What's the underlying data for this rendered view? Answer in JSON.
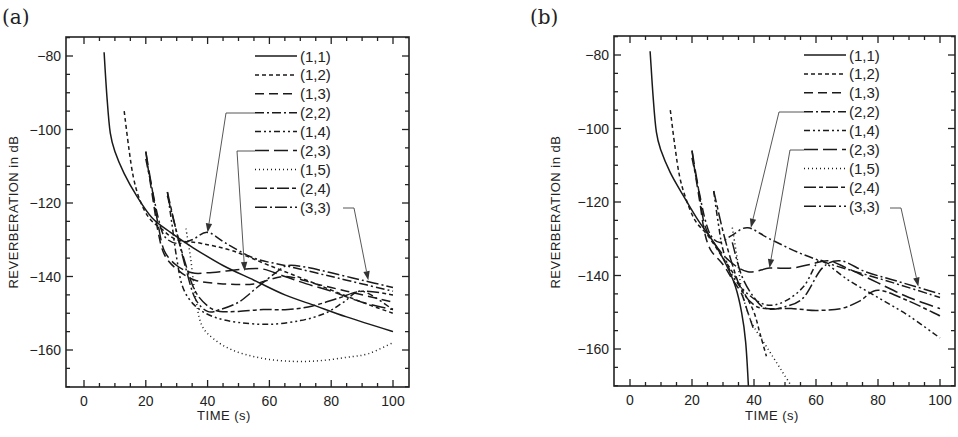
{
  "chart_data": [
    {
      "panel": "(a)",
      "type": "line",
      "title": "",
      "xlabel": "TIME (s)",
      "ylabel": "REVERBERATION in dB",
      "xlim": [
        -5,
        105
      ],
      "ylim": [
        -170,
        -75
      ],
      "xticks": [
        0,
        20,
        40,
        60,
        80,
        100
      ],
      "yticks": [
        -80,
        -100,
        -120,
        -140,
        -160
      ],
      "grid": false,
      "legend_position": "upper right (inside)",
      "series": [
        {
          "name": "(1,1)",
          "dash": "solid",
          "x": [
            6.5,
            7.5,
            8.5,
            10,
            13,
            17,
            22,
            28,
            35,
            45,
            55,
            65,
            75,
            85,
            100
          ],
          "y": [
            -79,
            -92,
            -101,
            -106,
            -112,
            -118,
            -124,
            -128,
            -132,
            -137,
            -141,
            -145,
            -148,
            -151,
            -155
          ]
        },
        {
          "name": "(1,2)",
          "dash": "short-dash",
          "x": [
            13,
            14.5,
            16,
            18,
            21,
            25,
            30,
            38,
            48,
            60,
            75,
            90,
            100
          ],
          "y": [
            -95,
            -105,
            -113,
            -119,
            -124,
            -127,
            -130,
            -131,
            -133,
            -137,
            -142,
            -147,
            -150
          ]
        },
        {
          "name": "(1,3)",
          "dash": "long-dash",
          "x": [
            20,
            21,
            22.5,
            24,
            26,
            30,
            36,
            45,
            55,
            65,
            75,
            85,
            95,
            100
          ],
          "y": [
            -106,
            -112,
            -120,
            -128,
            -134,
            -138,
            -141,
            -142,
            -142,
            -140,
            -142,
            -144,
            -146,
            -147
          ]
        },
        {
          "name": "(2,2)",
          "dash": "dash-dot",
          "x": [
            20,
            22,
            24,
            26,
            30,
            35,
            40,
            46,
            55,
            65,
            75,
            85,
            100
          ],
          "y": [
            -108,
            -116,
            -124,
            -129,
            -131,
            -130,
            -128,
            -131,
            -135,
            -137,
            -139,
            -141,
            -144
          ]
        },
        {
          "name": "(1,4)",
          "dash": "dash-dot-dot",
          "x": [
            27,
            28.5,
            30,
            32,
            36,
            42,
            50,
            60,
            70,
            78,
            84,
            90,
            100
          ],
          "y": [
            -117,
            -126,
            -135,
            -143,
            -148,
            -151,
            -152.5,
            -153,
            -152,
            -150,
            -147,
            -144,
            -149
          ]
        },
        {
          "name": "(2,3)",
          "dash": "long-long-dash",
          "x": [
            20,
            22,
            24,
            26,
            30,
            35,
            40,
            46,
            52,
            58,
            65,
            72,
            80,
            90,
            100
          ],
          "y": [
            -106,
            -116,
            -126,
            -133,
            -137,
            -139,
            -139,
            -138.5,
            -138,
            -138,
            -140,
            -142,
            -144,
            -147,
            -149
          ]
        },
        {
          "name": "(1,5)",
          "dash": "dotted",
          "x": [
            33,
            34.5,
            36,
            38,
            42,
            48,
            56,
            65,
            75,
            85,
            92,
            100
          ],
          "y": [
            -127,
            -135,
            -145,
            -153,
            -157,
            -160,
            -162,
            -163,
            -163,
            -162,
            -161,
            -158
          ]
        },
        {
          "name": "(2,4)",
          "dash": "long-short-short",
          "x": [
            27,
            30,
            33,
            36,
            40,
            44,
            50,
            58,
            66,
            74,
            82,
            90,
            100
          ],
          "y": [
            -117,
            -128,
            -137,
            -144,
            -148,
            -149.5,
            -149.5,
            -149,
            -149,
            -148,
            -146,
            -144,
            -145
          ]
        },
        {
          "name": "(3,3)",
          "dash": "long-dash-dot",
          "x": [
            27,
            30,
            33,
            36,
            40,
            44,
            50,
            56,
            62,
            66,
            72,
            80,
            90,
            100
          ],
          "y": [
            -118,
            -128,
            -138,
            -146,
            -149.5,
            -149,
            -147,
            -143,
            -139,
            -137,
            -137.5,
            -139,
            -141,
            -143
          ]
        }
      ],
      "annotations": [
        {
          "label": "(2,2)",
          "arrow_to": [
            40,
            -128
          ]
        },
        {
          "label": "(2,3)",
          "arrow_to": [
            52,
            -138.5
          ]
        },
        {
          "label": "(3,3)",
          "arrow_to": [
            92,
            -141
          ]
        }
      ]
    },
    {
      "panel": "(b)",
      "type": "line",
      "title": "",
      "xlabel": "TIME (s)",
      "ylabel": "REVERBERATION in dB",
      "xlim": [
        -5,
        105
      ],
      "ylim": [
        -170,
        -75
      ],
      "xticks": [
        0,
        20,
        40,
        60,
        80,
        100
      ],
      "yticks": [
        -80,
        -100,
        -120,
        -140,
        -160
      ],
      "grid": false,
      "legend_position": "upper right (inside)",
      "series": [
        {
          "name": "(1,1)",
          "dash": "solid",
          "x": [
            6.5,
            7.5,
            8.5,
            10,
            13,
            17,
            22,
            27,
            31,
            34,
            36,
            37.3,
            38.2
          ],
          "y": [
            -79,
            -92,
            -101,
            -106,
            -112,
            -118,
            -125,
            -131,
            -137,
            -143,
            -150,
            -158,
            -170
          ]
        },
        {
          "name": "(1,2)",
          "dash": "short-dash",
          "x": [
            13,
            14.5,
            16,
            18,
            21,
            25,
            29,
            33,
            37,
            40,
            42,
            44
          ],
          "y": [
            -95,
            -105,
            -113,
            -119,
            -125,
            -129,
            -134,
            -139,
            -145,
            -150,
            -156,
            -162
          ]
        },
        {
          "name": "(1,3)",
          "dash": "long-dash",
          "x": [
            20,
            21,
            22.5,
            24,
            26,
            30,
            33,
            36,
            38,
            40
          ],
          "y": [
            -106,
            -112,
            -120,
            -128,
            -133,
            -137,
            -141,
            -145,
            -150,
            -155
          ]
        },
        {
          "name": "(2,2)",
          "dash": "dash-dot",
          "x": [
            20,
            22,
            24,
            26,
            29,
            33,
            38,
            45,
            55,
            65,
            75,
            85,
            100
          ],
          "y": [
            -108,
            -116,
            -124,
            -129,
            -131,
            -129,
            -127,
            -130,
            -134,
            -137,
            -139.5,
            -142,
            -146
          ]
        },
        {
          "name": "(1,4)",
          "dash": "dash-dot-dot",
          "x": [
            27,
            28.5,
            30,
            33,
            38,
            44,
            50,
            56,
            60,
            62,
            70,
            80,
            90,
            100
          ],
          "y": [
            -117,
            -126,
            -133,
            -140,
            -145,
            -148,
            -147,
            -143,
            -137,
            -136,
            -141,
            -146,
            -151,
            -157
          ]
        },
        {
          "name": "(2,3)",
          "dash": "long-long-dash",
          "x": [
            20,
            22,
            24,
            27,
            32,
            38,
            45,
            52,
            58,
            64,
            70,
            80,
            90,
            100
          ],
          "y": [
            -106,
            -116,
            -126,
            -131,
            -136,
            -139,
            -138,
            -138,
            -137,
            -136,
            -138,
            -142,
            -146,
            -149
          ]
        },
        {
          "name": "(1,5)",
          "dash": "dotted",
          "x": [
            33,
            34.5,
            36,
            38,
            40,
            43,
            46,
            49,
            52
          ],
          "y": [
            -127,
            -135,
            -144,
            -150,
            -154,
            -158,
            -162,
            -166,
            -170
          ]
        },
        {
          "name": "(2,4)",
          "dash": "long-short-short",
          "x": [
            27,
            30,
            33,
            36,
            40,
            44,
            52,
            60,
            68,
            74,
            80,
            90,
            100
          ],
          "y": [
            -117,
            -128,
            -137,
            -144,
            -148,
            -149,
            -149,
            -149.5,
            -149,
            -147,
            -144,
            -147,
            -151
          ]
        },
        {
          "name": "(3,3)",
          "dash": "long-dash-dot",
          "x": [
            33,
            36,
            40,
            44,
            50,
            56,
            62,
            68,
            76,
            84,
            92,
            100
          ],
          "y": [
            -131,
            -140,
            -146,
            -149,
            -148.5,
            -146,
            -138,
            -136,
            -139,
            -141,
            -143,
            -145
          ]
        }
      ],
      "annotations": [
        {
          "label": "(2,2)",
          "arrow_to": [
            39,
            -127
          ]
        },
        {
          "label": "(2,3)",
          "arrow_to": [
            45,
            -138
          ]
        },
        {
          "label": "(3,3)",
          "arrow_to": [
            93,
            -143
          ]
        }
      ]
    }
  ],
  "panels": {
    "a": {
      "tag": "(a)",
      "xlabel": "TIME (s)",
      "ylabel": "REVERBERATION in dB"
    },
    "b": {
      "tag": "(b)",
      "xlabel": "TIME (s)",
      "ylabel": "REVERBERATION in dB"
    }
  },
  "colors": {
    "ink": "#1a1a1a",
    "background": "#ffffff"
  }
}
